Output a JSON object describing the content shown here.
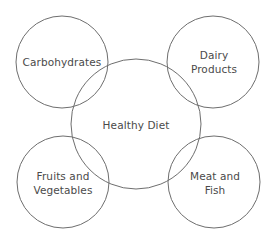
{
  "diagram": {
    "type": "venn-hub",
    "stroke_color": "#6e6e6e",
    "text_color": "#4a4a4a",
    "center": {
      "label": "Healthy Diet",
      "cx": 136,
      "cy": 124,
      "r": 65
    },
    "satellites": [
      {
        "id": "carbohydrates",
        "line1": "Carbohydrates",
        "line2": "",
        "cx": 62,
        "cy": 62,
        "r": 46
      },
      {
        "id": "dairy",
        "line1": "Dairy",
        "line2": "Products",
        "cx": 213,
        "cy": 62,
        "r": 46
      },
      {
        "id": "fruits",
        "line1": "Fruits and",
        "line2": "Vegetables",
        "cx": 63,
        "cy": 182,
        "r": 46
      },
      {
        "id": "meat",
        "line1": "Meat and",
        "line2": "Fish",
        "cx": 214,
        "cy": 182,
        "r": 46
      }
    ]
  }
}
